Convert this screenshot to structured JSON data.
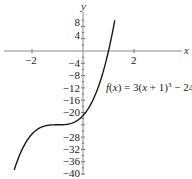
{
  "chart_data": {
    "type": "line",
    "title": "",
    "function_label": "f(x) = 3(x + 1)^3 − 24",
    "function_label_parts": {
      "f": "f",
      "open": "(",
      "x": "x",
      "mid": ") = 3(",
      "x2": "x",
      "tail": " + 1)",
      "exp": "3",
      "end": " − 24"
    },
    "xlabel": "x",
    "ylabel": "y",
    "xlim": [
      -3.3,
      4.3
    ],
    "ylim": [
      -40,
      10
    ],
    "x_ticks": [
      -2,
      2
    ],
    "x_tick_labels": [
      "−2",
      "2"
    ],
    "y_ticks": [
      8,
      4,
      -4,
      -8,
      -12,
      -16,
      -20,
      -28,
      -32,
      -36,
      -40
    ],
    "y_tick_labels": [
      "8",
      "4",
      "−4",
      "−8",
      "−12",
      "−16",
      "−20",
      "−28",
      "−32",
      "−36",
      "−40"
    ],
    "grid": false,
    "legend": null,
    "series": [
      {
        "name": "f(x) = 3(x + 1)^3 − 24",
        "x": [
          -2.7,
          -2.5,
          -2.0,
          -1.5,
          -1.0,
          -0.5,
          0.0,
          0.5,
          1.0,
          1.245
        ],
        "y": [
          -38.7,
          -34.1,
          -27.0,
          -24.4,
          -24.0,
          -23.6,
          -21.0,
          -13.9,
          0.0,
          10.0
        ]
      }
    ],
    "annotations": [
      {
        "text": "f(x) = 3(x + 1)^3 − 24",
        "x": 1.1,
        "y": -14
      }
    ]
  }
}
